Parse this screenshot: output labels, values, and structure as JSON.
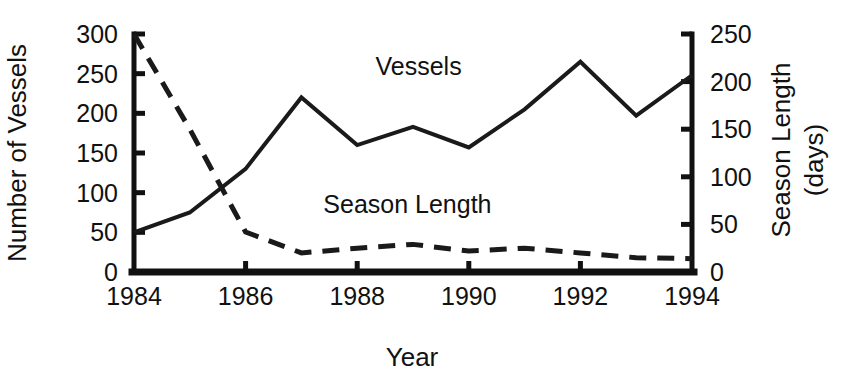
{
  "chart_data": {
    "type": "line",
    "title": "",
    "xlabel": "Year",
    "ylabel": "Number of Vessels",
    "y2label": "Season Length (days)",
    "grid": false,
    "legend_position": "inline-annotations",
    "x": [
      1984,
      1985,
      1986,
      1987,
      1988,
      1989,
      1990,
      1991,
      1992,
      1993,
      1994
    ],
    "xlim": [
      1984,
      1994
    ],
    "ylim": [
      0,
      300
    ],
    "y2lim": [
      0,
      250
    ],
    "xticks": [
      "1984",
      "1986",
      "1988",
      "1990",
      "1992",
      "1994"
    ],
    "xtick_values": [
      1984,
      1986,
      1988,
      1990,
      1992,
      1994
    ],
    "yticks": [
      "0",
      "50",
      "100",
      "150",
      "200",
      "250",
      "300"
    ],
    "ytick_values": [
      0,
      50,
      100,
      150,
      200,
      250,
      300
    ],
    "y2ticks": [
      "0",
      "50",
      "100",
      "150",
      "200",
      "250"
    ],
    "y2tick_values": [
      0,
      50,
      100,
      150,
      200,
      250
    ],
    "series": [
      {
        "name": "Vessels",
        "axis": "left",
        "style": "solid",
        "stroke_width": 4,
        "label_x": 1989.1,
        "label_y": 248,
        "values": [
          50,
          75,
          130,
          220,
          160,
          183,
          157,
          205,
          265,
          197,
          248
        ]
      },
      {
        "name": "Season Length",
        "axis": "right",
        "style": "dashed",
        "stroke_width": 5,
        "dash_pattern": "17,11",
        "label_x": 1988.9,
        "label_y": 75,
        "values": [
          250,
          150,
          42,
          20,
          25,
          29,
          22,
          25,
          20,
          15,
          14
        ]
      }
    ]
  },
  "axes": {
    "left_title": "Number of Vessels",
    "right_title_line1": "Season Length",
    "right_title_line2": "(days)",
    "bottom_title": "Year"
  },
  "annotations": {
    "vessels_label": "Vessels",
    "season_label": "Season Length"
  }
}
